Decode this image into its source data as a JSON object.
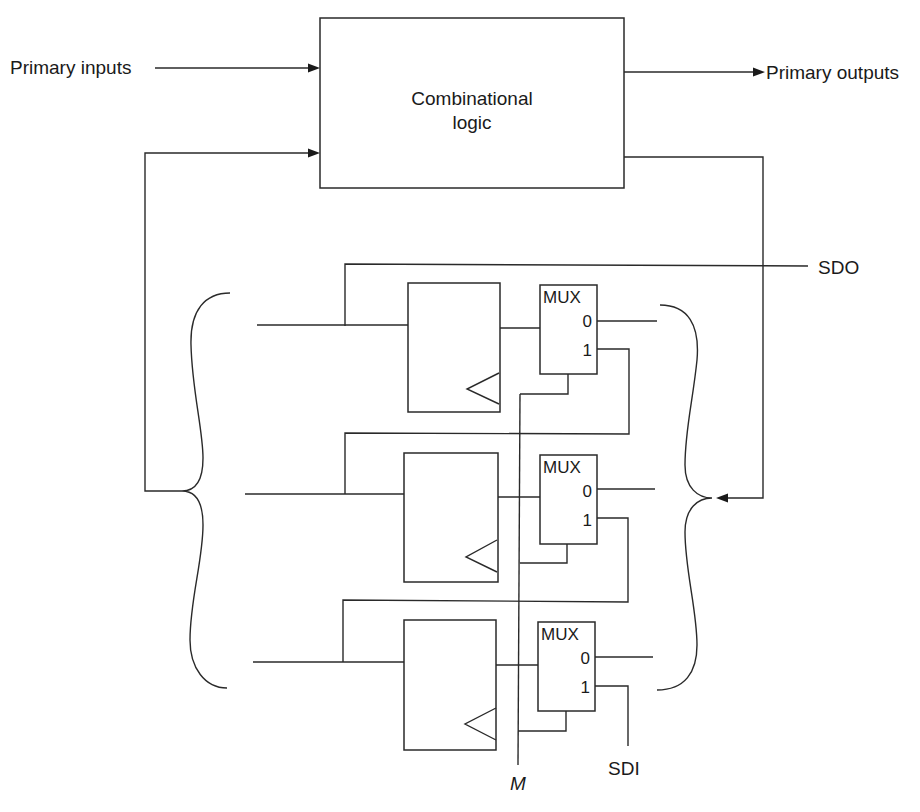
{
  "diagram": {
    "type": "scan-chain-sequential-circuit",
    "combinational_block": {
      "line1": "Combinational",
      "line2": "logic"
    },
    "labels": {
      "primary_inputs": "Primary inputs",
      "primary_outputs": "Primary outputs",
      "scan_data_out": "SDO",
      "scan_data_in": "SDI",
      "mode": "M"
    },
    "stages": [
      {
        "mux": {
          "title": "MUX",
          "pin0": "0",
          "pin1": "1"
        }
      },
      {
        "mux": {
          "title": "MUX",
          "pin0": "0",
          "pin1": "1"
        }
      },
      {
        "mux": {
          "title": "MUX",
          "pin0": "0",
          "pin1": "1"
        }
      }
    ],
    "colors": {
      "stroke": "#2a2a2a",
      "background": "#ffffff"
    }
  }
}
